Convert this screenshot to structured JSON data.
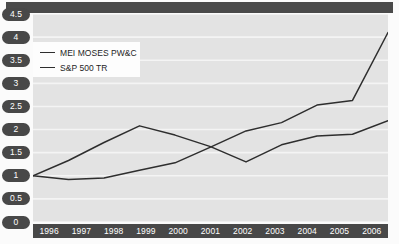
{
  "chart_data": {
    "type": "line",
    "title": "",
    "xlabel": "",
    "ylabel": "",
    "categories": [
      "1996",
      "1997",
      "1998",
      "1999",
      "2000",
      "2001",
      "2002",
      "2003",
      "2004",
      "2005",
      "2006"
    ],
    "x": [
      1996,
      1997,
      1998,
      1999,
      2000,
      2001,
      2002,
      2003,
      2004,
      2005,
      2006
    ],
    "ylim": [
      0,
      4.5
    ],
    "xlim": [
      1996,
      2006
    ],
    "yticks": [
      "0",
      "0.5",
      "1",
      "1.5",
      "2",
      "2.5",
      "3",
      "3.5",
      "4",
      "4.5"
    ],
    "ytick_values": [
      0,
      0.5,
      1,
      1.5,
      2,
      2.5,
      3,
      3.5,
      4,
      4.5
    ],
    "grid": "horizontal",
    "legend_position": "upper-left",
    "series": [
      {
        "name": "MEI MOSES PW&C",
        "color": "#2e2e2e",
        "values": [
          1.0,
          0.92,
          0.95,
          1.12,
          1.28,
          1.62,
          1.97,
          2.15,
          2.53,
          2.63,
          4.1
        ]
      },
      {
        "name": "S&P 500 TR",
        "color": "#2e2e2e",
        "values": [
          1.0,
          1.33,
          1.72,
          2.08,
          1.88,
          1.63,
          1.3,
          1.67,
          1.86,
          1.9,
          2.19
        ]
      }
    ]
  },
  "legend": {
    "entries": [
      {
        "label": "MEI MOSES PW&C"
      },
      {
        "label": "S&P 500 TR"
      }
    ]
  },
  "colors": {
    "band": "#4a4a4a",
    "axis_badge": "#484848",
    "plot_background": "#e3e3e3",
    "gridline": "#f4f4f4",
    "line": "#2e2e2e",
    "legend_background": "#fdfdfd",
    "axis_text": "#ffffff"
  }
}
